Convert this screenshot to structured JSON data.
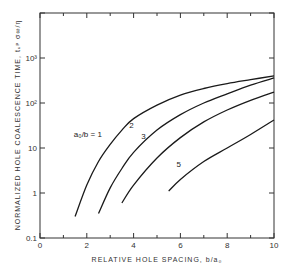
{
  "chart_data": {
    "type": "line",
    "title": "",
    "xlabel": "RELATIVE HOLE SPACING, b/a₀",
    "ylabel": "NORMALIZED HOLE COALESCENCE TIME, tᵤᵖ σ∞/η",
    "xlim": [
      0,
      10
    ],
    "ylim": [
      0.1,
      10000
    ],
    "yscale": "log",
    "grid": false,
    "x_ticks": [
      0,
      1,
      2,
      3,
      4,
      5,
      6,
      7,
      8,
      9,
      10
    ],
    "x_tick_labels": [
      "0",
      "",
      "2",
      "",
      "4",
      "",
      "6",
      "",
      "8",
      "",
      "10"
    ],
    "y_ticks": [
      0.1,
      1,
      10,
      100,
      1000,
      10000
    ],
    "y_tick_labels": [
      "0.1",
      "1",
      "10",
      "10²",
      "10³",
      ""
    ],
    "series": [
      {
        "name": "a₀/b = 1",
        "label": "a₀/b = 1",
        "x": [
          1.5,
          2.0,
          2.5,
          3.0,
          3.5,
          4.0,
          5.0,
          6.0,
          7.0,
          8.0,
          9.0,
          10.0
        ],
        "y": [
          0.3,
          1.5,
          5,
          12,
          25,
          45,
          90,
          150,
          210,
          270,
          330,
          400
        ]
      },
      {
        "name": "2",
        "label": "2",
        "x": [
          2.5,
          3.0,
          3.5,
          4.0,
          5.0,
          6.0,
          7.0,
          8.0,
          9.0,
          10.0
        ],
        "y": [
          0.35,
          1.3,
          3.5,
          8,
          25,
          55,
          100,
          160,
          250,
          360
        ]
      },
      {
        "name": "3",
        "label": "3",
        "x": [
          3.5,
          4.0,
          5.0,
          6.0,
          7.0,
          8.0,
          9.0,
          10.0
        ],
        "y": [
          0.6,
          1.5,
          6,
          17,
          38,
          70,
          115,
          175
        ]
      },
      {
        "name": "5",
        "label": "5",
        "x": [
          5.5,
          6.0,
          7.0,
          8.0,
          9.0,
          10.0
        ],
        "y": [
          1.1,
          2,
          5,
          10,
          20,
          42
        ]
      }
    ]
  }
}
